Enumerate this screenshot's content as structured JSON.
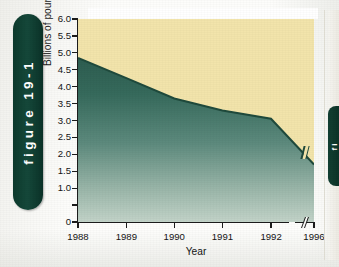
{
  "figure": {
    "tab_label": "figure 19-1",
    "tab_color": "#0d3a2d"
  },
  "neighbor": {
    "tab_label": "fi"
  },
  "colors": {
    "area_fill_top": "#2e5e52",
    "area_fill_bottom": "#bccfc4",
    "background_fill": "#f2e4ab",
    "line": "#1f4a3c",
    "axis": "#1c1c1c",
    "tab": "#0d3a2d"
  },
  "chart_data": {
    "type": "area",
    "title": "",
    "xlabel": "Year",
    "ylabel": "Billions of pounds",
    "x": [
      1988,
      1989,
      1990,
      1991,
      1992,
      1996
    ],
    "values": [
      4.85,
      4.25,
      3.65,
      3.3,
      3.05,
      1.7
    ],
    "series": [
      {
        "name": "Billions of pounds",
        "values": [
          4.85,
          4.25,
          3.65,
          3.3,
          3.05,
          1.7
        ]
      }
    ],
    "ylim": [
      0,
      6.0
    ],
    "ytick_values": [
      6.0,
      5.5,
      5.0,
      4.5,
      4.0,
      3.5,
      3.0,
      2.5,
      2.0,
      1.5,
      1.0,
      0.5,
      0
    ],
    "ytick_labels": [
      "6.0",
      "5.5",
      "5.0",
      "4.5",
      "4.0",
      "3.5",
      "3.0",
      "2.5",
      "2.0",
      "1.5",
      "1.0",
      "",
      "0"
    ],
    "xtick_labels": [
      "1988",
      "1989",
      "1990",
      "1991",
      "1992",
      "1996"
    ],
    "axis_break": true,
    "axis_break_between": [
      "1992",
      "1996"
    ],
    "grid": false,
    "legend": "none"
  }
}
